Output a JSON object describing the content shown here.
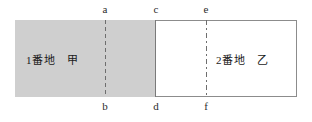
{
  "figure": {
    "title": "",
    "parcels": [
      {
        "id": "lot-1",
        "label": "1番地　甲",
        "fill": "#cfcfcf",
        "shaded": true
      },
      {
        "id": "lot-2",
        "label": "2番地　乙",
        "fill": "#ffffff",
        "shaded": false
      }
    ],
    "points": {
      "top": [
        {
          "id": "a",
          "label": "a"
        },
        {
          "id": "c",
          "label": "c"
        },
        {
          "id": "e",
          "label": "e"
        }
      ],
      "bottom": [
        {
          "id": "b",
          "label": "b"
        },
        {
          "id": "d",
          "label": "d"
        },
        {
          "id": "f",
          "label": "f"
        }
      ]
    },
    "dividers": [
      {
        "id": "ab",
        "style": "dashed",
        "from": "a",
        "to": "b"
      },
      {
        "id": "cd",
        "style": "solid",
        "from": "c",
        "to": "d"
      },
      {
        "id": "ef",
        "style": "dash-dot",
        "from": "e",
        "to": "f"
      }
    ],
    "colors": {
      "outline": "#8c8c8c",
      "shaded_fill": "#cfcfcf",
      "divider": "#6e6e6e",
      "text": "#1a1a1a",
      "background": "#ffffff"
    }
  }
}
